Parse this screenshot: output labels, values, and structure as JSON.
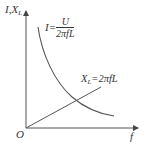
{
  "diagram": {
    "y_axis_label": {
      "main": "I,X",
      "sub": "L"
    },
    "x_axis_label": "f",
    "origin_label": "O",
    "curve_current": {
      "lhs": "I=",
      "numerator": "U",
      "denominator": "2πfL",
      "description": "hyperbolic decreasing curve of current vs frequency"
    },
    "line_reactance": {
      "lhs_main": "X",
      "lhs_sub": "L",
      "rhs": "=2πfL",
      "description": "straight line from origin, reactance proportional to frequency"
    },
    "colors": {
      "stroke": "#444444",
      "text": "#333333",
      "background": "#ffffff"
    }
  }
}
